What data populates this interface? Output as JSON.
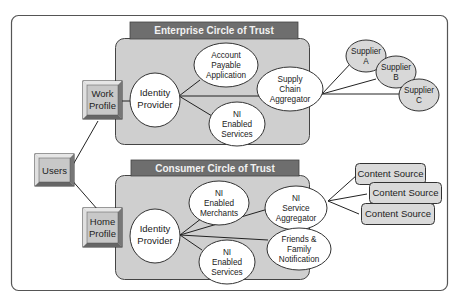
{
  "diagram": {
    "colors": {
      "frame_border": "#555555",
      "panel_fill": "#cfcfcf",
      "panel_border": "#444444",
      "header_fill": "#6e6e6e",
      "header_text": "#f2f2f2",
      "node_fill": "#ffffff",
      "supplier_fill": "#d8d8d8",
      "content_fill": "#dadada",
      "bevel_box_fill": "#c8c8c8"
    },
    "users": {
      "label": "Users"
    },
    "work_profile": {
      "line1": "Work",
      "line2": "Profile"
    },
    "home_profile": {
      "line1": "Home",
      "line2": "Profile"
    },
    "enterprise": {
      "title": "Enterprise Circle of Trust",
      "identity_provider": {
        "line1": "Identity",
        "line2": "Provider"
      },
      "account_payable": {
        "line1": "Account",
        "line2": "Payable",
        "line3": "Application"
      },
      "ni_enabled_services": {
        "line1": "NI",
        "line2": "Enabled",
        "line3": "Services"
      },
      "supply_chain": {
        "line1": "Supply",
        "line2": "Chain",
        "line3": "Aggregator"
      },
      "suppliers": [
        {
          "line1": "Supplier",
          "line2": "A"
        },
        {
          "line1": "Supplier",
          "line2": "B"
        },
        {
          "line1": "Supplier",
          "line2": "C"
        }
      ]
    },
    "consumer": {
      "title": "Consumer Circle of Trust",
      "identity_provider": {
        "line1": "Identity",
        "line2": "Provider"
      },
      "ni_enabled_merchants": {
        "line1": "NI",
        "line2": "Enabled",
        "line3": "Merchants"
      },
      "ni_enabled_services": {
        "line1": "NI",
        "line2": "Enabled",
        "line3": "Services"
      },
      "ni_service_aggregator": {
        "line1": "NI",
        "line2": "Service",
        "line3": "Aggregator"
      },
      "friends_family": {
        "line1": "Friends &",
        "line2": "Family",
        "line3": "Notification"
      },
      "content_sources": [
        {
          "label": "Content Source"
        },
        {
          "label": "Content Source"
        },
        {
          "label": "Content Source"
        }
      ]
    }
  }
}
